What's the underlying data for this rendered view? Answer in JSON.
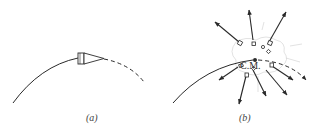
{
  "figure": {
    "panels": [
      {
        "id": "a",
        "caption": "(a)",
        "description": "Projectile (shell) on a parabolic trajectory; solid path before, dashed path after"
      },
      {
        "id": "b",
        "caption": "(b)",
        "description": "Shell explodes into fragments flying outward; center of mass continues on the same trajectory",
        "cm_label": "C.M.",
        "fragment_count": 9
      }
    ],
    "colors": {
      "ink": "#2a2a2a",
      "faint": "#c8c8c8",
      "background": "#ffffff"
    }
  }
}
